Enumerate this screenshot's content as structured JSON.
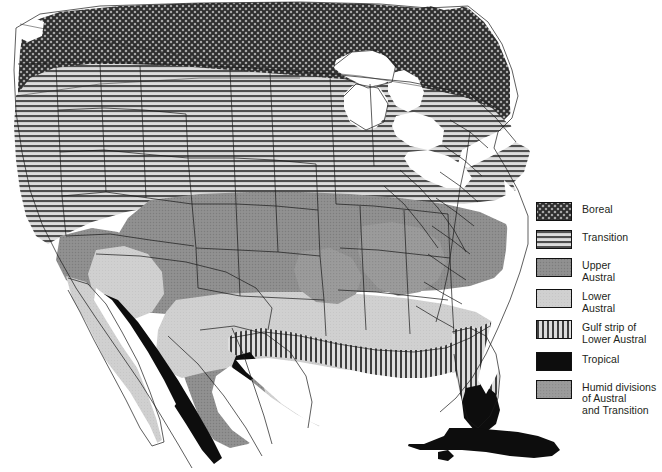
{
  "figure": {
    "type": "thematic-map",
    "projection_note": "United States, southern Canada, Mexico, Cuba",
    "background_color": "#ffffff",
    "outline_color": "#111111",
    "width": 662,
    "height": 472
  },
  "legend": {
    "position": "right",
    "items": [
      {
        "id": "boreal",
        "label": "Boreal",
        "pattern": "cross-hatch-checker",
        "fill": "#8f8f8f",
        "ink": "#2b2b2b"
      },
      {
        "id": "transition",
        "label": "Transition",
        "pattern": "horizontal-lines",
        "fill": "#d2d2d2",
        "ink": "#4a4a4a"
      },
      {
        "id": "upper-austral",
        "label": "Upper\nAustral",
        "pattern": "solid-stipple",
        "fill": "#8c8c8c",
        "ink": "#8c8c8c"
      },
      {
        "id": "lower-austral",
        "label": "Lower\nAustral",
        "pattern": "solid-light",
        "fill": "#cfcfcf",
        "ink": "#cfcfcf"
      },
      {
        "id": "gulf-strip",
        "label": "Gulf strip of\nLower Austral",
        "pattern": "vertical-lines",
        "fill": "#d2d2d2",
        "ink": "#3c3c3c"
      },
      {
        "id": "tropical",
        "label": "Tropical",
        "pattern": "solid-black",
        "fill": "#0d0d0d",
        "ink": "#0d0d0d"
      },
      {
        "id": "humid-divisions",
        "label": "Humid divisions\nof Austral\nand Transition",
        "pattern": "solid-mid",
        "fill": "#9a9a9a",
        "ink": "#9a9a9a"
      }
    ]
  },
  "map_regions": {
    "boreal_note": "Canada north of the Great Lakes, Rocky Mountain and Cascade/Sierra ranges, Appalachian highlands",
    "transition_note": "Pacific Northwest, northern Great Plains, Great Lakes states, New England",
    "upper_austral_note": "Central plains, Ohio Valley, mid-Atlantic, northern Mexican plateau",
    "lower_austral_note": "Southeastern coastal plain, Texas, Baja California, Mexican lowlands",
    "gulf_strip_note": "Gulf of Mexico coastline from Texas through Florida",
    "tropical_note": "Southern Florida, Cuba, Pacific and Gulf coasts of southern Mexico",
    "water_note": "Great Lakes, Gulf of Mexico, Pacific and Atlantic oceans shown white"
  }
}
